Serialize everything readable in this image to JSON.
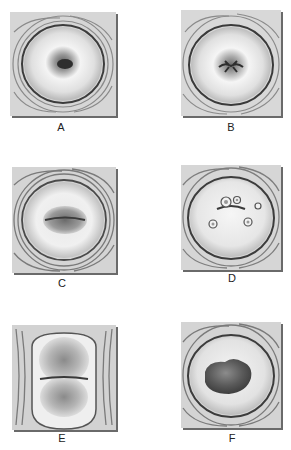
{
  "figure": {
    "panels": [
      {
        "id": "A",
        "label": "A",
        "description": "Normal nulliparous cervix with small round os"
      },
      {
        "id": "B",
        "label": "B",
        "description": "Parous cervix with transverse slit os"
      },
      {
        "id": "C",
        "label": "C",
        "description": "Cervix with everted, granular os (ectropion/erosion)"
      },
      {
        "id": "D",
        "label": "D",
        "description": "Cervix with multiple small nabothian cysts"
      },
      {
        "id": "E",
        "label": "E",
        "description": "Cervix with large bilobed granular eversion"
      },
      {
        "id": "F",
        "label": "F",
        "description": "Cervix with irregular central mass"
      }
    ],
    "colors": {
      "background": "#ffffff",
      "tile": "#d8d8d8",
      "ring": "#4a4a4a",
      "os_dark": "#3a3a3a"
    }
  }
}
